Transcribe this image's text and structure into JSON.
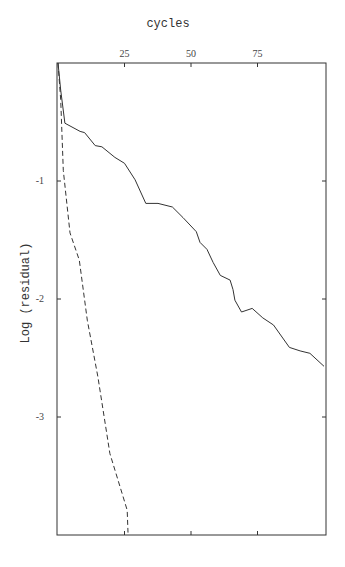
{
  "chart_data": {
    "type": "line",
    "title": "cycles",
    "xlabel": "cycles",
    "ylabel": "Log (residual)",
    "xlim": [
      0,
      101
    ],
    "ylim": [
      -3.98,
      0
    ],
    "x_ticks": [
      25,
      50,
      75
    ],
    "y_ticks": [
      -1,
      -2,
      -3
    ],
    "x_axis_position": "top",
    "grid": false,
    "legend": null,
    "series": [
      {
        "name": "solid",
        "style": "solid",
        "color": "#333333",
        "x": [
          0,
          1,
          2.6,
          8.3,
          10,
          14,
          16.5,
          21.4,
          25,
          29,
          33,
          37.6,
          43,
          47,
          52,
          53.4,
          56,
          58.3,
          61,
          64.7,
          65.8,
          66.5,
          69,
          73,
          77,
          81,
          87,
          91,
          94.7,
          100
        ],
        "y": [
          0,
          -0.23,
          -0.51,
          -0.58,
          -0.59,
          -0.7,
          -0.71,
          -0.8,
          -0.85,
          -0.99,
          -1.19,
          -1.19,
          -1.22,
          -1.31,
          -1.43,
          -1.52,
          -1.58,
          -1.69,
          -1.8,
          -1.84,
          -1.92,
          -2.01,
          -2.11,
          -2.08,
          -2.16,
          -2.22,
          -2.41,
          -2.44,
          -2.46,
          -2.57
        ]
      },
      {
        "name": "dashed",
        "style": "dashed",
        "color": "#333333",
        "x": [
          0,
          1,
          2,
          4.5,
          8,
          11,
          15,
          19.5,
          23.3,
          26,
          26.3
        ],
        "y": [
          0,
          -0.31,
          -0.91,
          -1.44,
          -1.67,
          -2.18,
          -2.66,
          -3.31,
          -3.59,
          -3.79,
          -3.98
        ]
      }
    ]
  }
}
